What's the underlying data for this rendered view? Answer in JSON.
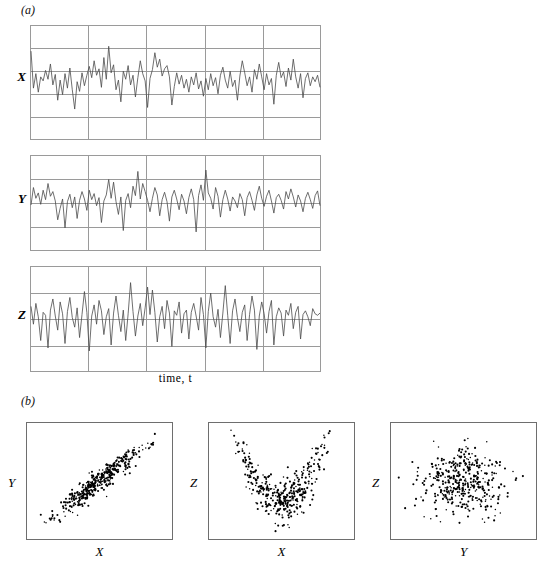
{
  "figure": {
    "panels": [
      {
        "id": "a",
        "letter": "(a)"
      },
      {
        "id": "b",
        "letter": "(b)"
      }
    ]
  },
  "timeseries": {
    "time_axis_label": "time, t",
    "rows": [
      {
        "label": "X",
        "name": "series-x"
      },
      {
        "label": "Y",
        "name": "series-y"
      },
      {
        "label": "Z",
        "name": "series-z"
      }
    ]
  },
  "scatter": {
    "plots": [
      {
        "xlabel": "X",
        "ylabel": "Y",
        "name": "scatter-x-y"
      },
      {
        "xlabel": "X",
        "ylabel": "Z",
        "name": "scatter-x-z"
      },
      {
        "xlabel": "Y",
        "ylabel": "Z",
        "name": "scatter-y-z"
      }
    ]
  },
  "style": {
    "grid_color": "#9a9a9a",
    "trace_color": "#4a4a4a",
    "point_color": "#000000",
    "box_border_color": "#6e6e6e",
    "background": "#ffffff"
  },
  "chart_data": {
    "type": "line",
    "title": "",
    "subtitle": "",
    "xlabel": "time, t",
    "ylabel": "",
    "grid": true,
    "legend_position": "none",
    "panels": [
      {
        "id": "a",
        "type": "line",
        "xlabel": "time, t",
        "n_vertical_gridlines": 4,
        "n_horizontal_gridlines": 4,
        "series": [
          {
            "name": "X",
            "n_points": 120,
            "ylim": [
              -3.0,
              3.0
            ],
            "values": [
              1.95,
              -0.35,
              0.55,
              -0.6,
              0.35,
              0.1,
              0.75,
              0.2,
              1.15,
              -0.15,
              0.5,
              -1.1,
              0.15,
              -0.75,
              0.55,
              -0.35,
              0.9,
              -0.45,
              -1.65,
              0.05,
              -0.55,
              0.6,
              -0.2,
              0.45,
              1.0,
              0.3,
              1.35,
              0.45,
              0.85,
              -0.3,
              1.55,
              0.2,
              2.25,
              0.6,
              1.1,
              -0.45,
              0.15,
              -1.2,
              0.7,
              0.2,
              1.05,
              -0.15,
              0.45,
              -0.9,
              0.3,
              1.35,
              0.55,
              0.1,
              -1.55,
              0.25,
              0.8,
              1.85,
              0.95,
              1.45,
              0.4,
              0.85,
              1.05,
              0.35,
              -1.4,
              -0.25,
              0.6,
              -0.1,
              0.45,
              -0.35,
              0.2,
              -0.6,
              0.35,
              -0.15,
              0.6,
              -0.4,
              0.1,
              -0.85,
              0.25,
              -0.45,
              0.55,
              -0.2,
              0.3,
              -0.7,
              0.45,
              0.95,
              0.15,
              -0.35,
              0.7,
              -0.25,
              0.15,
              -1.1,
              0.4,
              1.35,
              0.6,
              -0.2,
              0.35,
              -0.6,
              0.8,
              0.2,
              1.15,
              0.35,
              -0.45,
              0.55,
              -0.15,
              0.25,
              -1.35,
              0.45,
              1.25,
              0.3,
              0.65,
              -0.25,
              0.9,
              0.15,
              1.45,
              0.35,
              -0.35,
              0.55,
              -0.95,
              0.25,
              0.6,
              -0.2,
              0.35,
              0.05,
              0.45,
              -0.3
            ]
          },
          {
            "name": "Y",
            "n_points": 120,
            "ylim": [
              -3.0,
              3.0
            ],
            "values": [
              -0.15,
              1.15,
              0.35,
              0.75,
              -0.1,
              0.95,
              0.25,
              1.45,
              0.5,
              0.85,
              0.15,
              -1.25,
              -0.4,
              0.3,
              -1.85,
              0.1,
              0.65,
              -0.35,
              0.45,
              -1.15,
              0.2,
              0.85,
              0.3,
              -0.55,
              0.95,
              0.25,
              0.7,
              -0.2,
              0.4,
              -1.45,
              0.15,
              0.6,
              1.75,
              0.35,
              1.55,
              0.1,
              -0.85,
              0.45,
              -2.05,
              0.2,
              0.7,
              -0.35,
              1.25,
              0.55,
              2.35,
              0.3,
              1.45,
              0.85,
              0.2,
              -0.65,
              0.35,
              1.15,
              0.6,
              -0.95,
              0.25,
              0.8,
              0.1,
              -1.35,
              0.45,
              0.95,
              0.3,
              -0.5,
              0.65,
              0.15,
              -0.8,
              0.4,
              1.05,
              0.25,
              -2.15,
              0.55,
              1.35,
              0.2,
              2.45,
              0.75,
              0.35,
              -0.45,
              1.15,
              0.5,
              -1.05,
              0.25,
              0.95,
              0.3,
              -0.6,
              0.45,
              0.15,
              -0.35,
              0.7,
              0.25,
              -0.95,
              0.4,
              0.85,
              0.2,
              -0.55,
              0.6,
              1.25,
              0.35,
              -0.25,
              0.5,
              0.95,
              0.15,
              -0.75,
              0.4,
              0.65,
              0.2,
              -0.45,
              0.85,
              0.3,
              1.05,
              0.45,
              -0.3,
              0.6,
              0.15,
              -0.65,
              0.35,
              0.8,
              0.25,
              -0.4,
              0.55,
              0.9,
              -0.2
            ]
          },
          {
            "name": "Z",
            "n_points": 120,
            "ylim": [
              -3.0,
              3.0
            ],
            "values": [
              0.85,
              -0.35,
              1.05,
              0.15,
              -1.45,
              0.45,
              0.25,
              -1.95,
              0.6,
              1.35,
              0.2,
              -0.75,
              1.15,
              0.35,
              -1.65,
              0.5,
              1.45,
              0.1,
              -0.55,
              0.75,
              -1.25,
              0.3,
              1.85,
              0.45,
              -2.15,
              0.2,
              0.95,
              -0.35,
              1.25,
              0.55,
              -1.05,
              0.15,
              0.7,
              -1.75,
              0.4,
              1.55,
              0.25,
              -0.85,
              0.6,
              -1.45,
              0.35,
              2.45,
              0.5,
              -1.15,
              0.2,
              1.05,
              -0.45,
              0.75,
              2.15,
              0.3,
              1.95,
              0.45,
              -1.55,
              0.15,
              0.85,
              -0.65,
              1.25,
              0.4,
              -1.85,
              0.55,
              0.25,
              1.15,
              -0.95,
              0.35,
              0.6,
              -1.35,
              0.45,
              1.05,
              0.2,
              -0.75,
              1.45,
              0.3,
              -1.95,
              0.5,
              1.75,
              0.15,
              -0.55,
              0.65,
              -1.25,
              0.4,
              2.25,
              0.25,
              -1.65,
              0.55,
              1.35,
              0.1,
              -0.85,
              0.45,
              0.95,
              -1.45,
              0.3,
              1.55,
              0.6,
              -2.05,
              0.2,
              1.15,
              0.35,
              -0.95,
              0.5,
              1.25,
              -1.75,
              0.15,
              0.75,
              0.4,
              -1.15,
              0.6,
              0.25,
              1.05,
              -0.65,
              0.45,
              0.85,
              -1.35,
              0.3,
              0.55,
              0.15,
              -0.45,
              0.7,
              0.35,
              0.25,
              0.4
            ]
          }
        ]
      },
      {
        "id": "b",
        "type": "scatter",
        "plots": [
          {
            "name": "scatter-x-y",
            "xlabel": "X",
            "ylabel": "Y",
            "n_points": 400,
            "relationship": "strong positive linear correlation",
            "correlation": 0.9
          },
          {
            "name": "scatter-x-z",
            "xlabel": "X",
            "ylabel": "Z",
            "n_points": 400,
            "relationship": "U-shaped quadratic dependence, near-zero linear correlation",
            "correlation": 0.0
          },
          {
            "name": "scatter-y-z",
            "xlabel": "Y",
            "ylabel": "Z",
            "n_points": 400,
            "relationship": "no association, isotropic cloud",
            "correlation": 0.0
          }
        ]
      }
    ]
  }
}
